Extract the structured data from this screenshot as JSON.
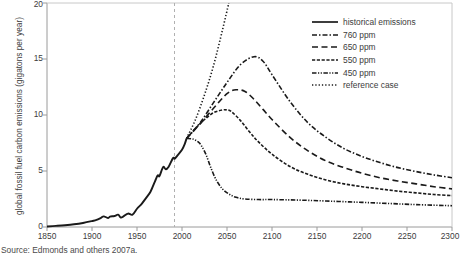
{
  "chart_data": {
    "type": "line",
    "title": "",
    "xlabel": "",
    "ylabel": "global fossil fuel carbon emissions (gigatons per year)",
    "xlim": [
      1850,
      2300
    ],
    "ylim": [
      0,
      20
    ],
    "xticks": [
      1850,
      1900,
      1950,
      2000,
      2050,
      2100,
      2150,
      2200,
      2250,
      2300
    ],
    "yticks": [
      0,
      5,
      10,
      15,
      20
    ],
    "grid": false,
    "legend_position": "top-right",
    "annotations": [
      {
        "name": "present-day-marker",
        "type": "vline",
        "x": 2005,
        "style": "dashed",
        "color": "#aaaaaa"
      }
    ],
    "series": [
      {
        "name": "historical emissions",
        "style": "solid",
        "color": "#1a1a1a",
        "x": [
          1850,
          1860,
          1870,
          1880,
          1890,
          1900,
          1905,
          1910,
          1913,
          1918,
          1920,
          1925,
          1929,
          1932,
          1935,
          1940,
          1945,
          1950,
          1955,
          1960,
          1965,
          1970,
          1973,
          1975,
          1979,
          1982,
          1985,
          1990,
          1992,
          1995,
          2000,
          2003,
          2005
        ],
        "y": [
          0.05,
          0.1,
          0.16,
          0.24,
          0.36,
          0.53,
          0.63,
          0.82,
          0.95,
          0.8,
          0.93,
          0.98,
          1.1,
          0.85,
          0.95,
          1.2,
          1.1,
          1.63,
          2.05,
          2.58,
          3.15,
          4.08,
          4.6,
          4.55,
          5.35,
          5.15,
          5.35,
          6.15,
          6.1,
          6.4,
          6.9,
          7.4,
          7.9
        ]
      },
      {
        "name": "760 ppm",
        "style": "dashdot",
        "color": "#1a1a1a",
        "x": [
          2005,
          2020,
          2035,
          2050,
          2065,
          2080,
          2090,
          2100,
          2120,
          2140,
          2160,
          2180,
          2200,
          2220,
          2240,
          2260,
          2280,
          2300
        ],
        "y": [
          7.9,
          9.3,
          11.1,
          12.9,
          14.5,
          15.2,
          14.8,
          13.6,
          11.2,
          9.3,
          8.0,
          7.0,
          6.3,
          5.75,
          5.3,
          4.95,
          4.65,
          4.4
        ]
      },
      {
        "name": "650 ppm",
        "style": "longdash",
        "color": "#1a1a1a",
        "x": [
          2005,
          2020,
          2035,
          2050,
          2060,
          2070,
          2080,
          2090,
          2100,
          2120,
          2140,
          2160,
          2180,
          2200,
          2220,
          2240,
          2260,
          2280,
          2300
        ],
        "y": [
          7.9,
          9.2,
          10.6,
          11.9,
          12.25,
          12.1,
          11.4,
          10.5,
          9.6,
          8.0,
          6.8,
          5.9,
          5.3,
          4.8,
          4.4,
          4.1,
          3.85,
          3.6,
          3.4
        ]
      },
      {
        "name": "550 ppm",
        "style": "shortdash",
        "color": "#1a1a1a",
        "x": [
          2005,
          2015,
          2025,
          2035,
          2045,
          2050,
          2055,
          2065,
          2075,
          2085,
          2100,
          2120,
          2140,
          2160,
          2180,
          2200,
          2220,
          2240,
          2260,
          2280,
          2300
        ],
        "y": [
          7.9,
          8.8,
          9.6,
          10.2,
          10.45,
          10.45,
          10.3,
          9.5,
          8.5,
          7.6,
          6.5,
          5.4,
          4.7,
          4.2,
          3.85,
          3.6,
          3.4,
          3.2,
          3.05,
          2.9,
          2.8
        ]
      },
      {
        "name": "450 ppm",
        "style": "dashdotdot",
        "color": "#1a1a1a",
        "x": [
          2005,
          2012,
          2018,
          2022,
          2027,
          2032,
          2038,
          2045,
          2052,
          2060,
          2070,
          2085,
          2100,
          2120,
          2140,
          2160,
          2180,
          2200,
          2230,
          2260,
          2300
        ],
        "y": [
          7.9,
          7.85,
          7.6,
          7.2,
          6.4,
          5.3,
          4.2,
          3.4,
          2.95,
          2.65,
          2.5,
          2.45,
          2.45,
          2.42,
          2.38,
          2.32,
          2.26,
          2.2,
          2.1,
          2.0,
          1.9
        ]
      },
      {
        "name": "reference case",
        "style": "dotted",
        "color": "#1a1a1a",
        "x": [
          2005,
          2015,
          2025,
          2035,
          2045,
          2052
        ],
        "y": [
          7.9,
          9.6,
          11.8,
          14.4,
          17.6,
          20.0
        ]
      }
    ]
  },
  "legend": {
    "items": [
      {
        "label": "historical emissions",
        "style": "solid"
      },
      {
        "label": "760 ppm",
        "style": "dashdot"
      },
      {
        "label": "650 ppm",
        "style": "longdash"
      },
      {
        "label": "550 ppm",
        "style": "shortdash"
      },
      {
        "label": "450 ppm",
        "style": "dashdotdot"
      },
      {
        "label": "reference case",
        "style": "dotted"
      }
    ]
  },
  "caption": {
    "source": "Source: Edmonds and others 2007a."
  },
  "axes": {
    "y_title": "global fossil fuel carbon emissions (gigatons per year)",
    "y_tick_labels": [
      "0",
      "5",
      "10",
      "15",
      "20"
    ],
    "x_tick_labels": [
      "1850",
      "1900",
      "1950",
      "2000",
      "2050",
      "2100",
      "2150",
      "2200",
      "2250",
      "2300"
    ]
  },
  "colors": {
    "line": "#1a1a1a",
    "axis": "#9a9a9a",
    "text": "#3c3c3c",
    "marker_line": "#aaaaaa"
  }
}
